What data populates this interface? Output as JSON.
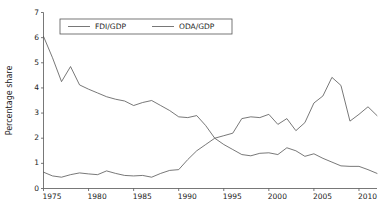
{
  "chart_data": {
    "type": "line",
    "title": "",
    "subtitle": "",
    "xlabel": "",
    "ylabel": "Percentage share",
    "xlim": [
      1975,
      2012
    ],
    "ylim": [
      0,
      7
    ],
    "ytick_values": [
      0,
      1,
      2,
      3,
      4,
      5,
      6,
      7
    ],
    "ytick_labels": [
      "0",
      "1",
      "2",
      "3",
      "4",
      "5",
      "6",
      "7"
    ],
    "xtick_values": [
      1975,
      1980,
      1985,
      1990,
      1995,
      2000,
      2005,
      2010
    ],
    "xtick_labels": [
      "1975",
      "1980",
      "1985",
      "1990",
      "1995",
      "2000",
      "2005",
      "2010"
    ],
    "grid": false,
    "legend_position": "top-center",
    "x": [
      1975,
      1976,
      1977,
      1978,
      1979,
      1980,
      1981,
      1982,
      1983,
      1984,
      1985,
      1986,
      1987,
      1988,
      1989,
      1990,
      1991,
      1992,
      1993,
      1994,
      1995,
      1996,
      1997,
      1998,
      1999,
      2000,
      2001,
      2002,
      2003,
      2004,
      2005,
      2006,
      2007,
      2008,
      2009,
      2010,
      2011,
      2012
    ],
    "series": [
      {
        "name": "FDI/GDP",
        "color": "#555555",
        "values": [
          0.65,
          0.5,
          0.45,
          0.55,
          0.62,
          0.58,
          0.55,
          0.7,
          0.6,
          0.52,
          0.5,
          0.52,
          0.45,
          0.6,
          0.72,
          0.75,
          1.15,
          1.5,
          1.75,
          2.0,
          2.1,
          2.2,
          2.78,
          2.85,
          2.82,
          2.95,
          2.55,
          2.78,
          2.3,
          2.62,
          3.4,
          3.68,
          4.42,
          4.1,
          2.68,
          2.95,
          3.25,
          2.9
        ]
      },
      {
        "name": "ODA/GDP",
        "color": "#555555",
        "values": [
          6.05,
          5.2,
          4.25,
          4.85,
          4.12,
          3.95,
          3.8,
          3.65,
          3.55,
          3.48,
          3.3,
          3.42,
          3.5,
          3.3,
          3.1,
          2.85,
          2.82,
          2.9,
          2.5,
          2.0,
          1.75,
          1.55,
          1.35,
          1.3,
          1.4,
          1.42,
          1.35,
          1.62,
          1.5,
          1.28,
          1.38,
          1.2,
          1.05,
          0.9,
          0.88,
          0.88,
          0.75,
          0.6
        ]
      }
    ]
  }
}
